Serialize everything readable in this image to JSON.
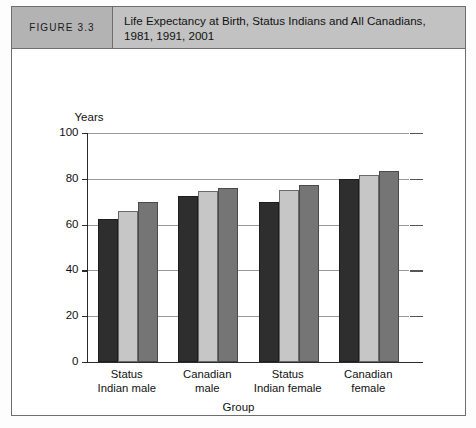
{
  "figure": {
    "tag": "FIGURE 3.3",
    "title": "Life Expectancy at Birth, Status Indians and All Canadians, 1981, 1991, 2001"
  },
  "chart_data": {
    "type": "bar",
    "title": "Life Expectancy at Birth, Status Indians and All Canadians, 1981, 1991, 2001",
    "xlabel": "Group",
    "ylabel": "Years",
    "ylim": [
      0,
      100
    ],
    "yticks": [
      0,
      20,
      40,
      60,
      80,
      100
    ],
    "ytick_labels": [
      "0",
      "20",
      "40",
      "60",
      "80",
      "100"
    ],
    "grid": true,
    "legend_position": "bottom",
    "categories": [
      "Status Indian male",
      "Canadian male",
      "Status Indian female",
      "Canadian female"
    ],
    "category_lines": [
      [
        "Status",
        "Indian male"
      ],
      [
        "Canadian",
        "male"
      ],
      [
        "Status",
        "Indian female"
      ],
      [
        "Canadian",
        "female"
      ]
    ],
    "series": [
      {
        "name": "1981",
        "color": "#2e2e2e",
        "values": [
          62.5,
          72.5,
          70.0,
          80.0
        ]
      },
      {
        "name": "1991",
        "color": "#c6c6c6",
        "values": [
          66.0,
          74.5,
          75.0,
          81.5
        ]
      },
      {
        "name": "2001",
        "color": "#757575",
        "values": [
          70.0,
          76.0,
          77.5,
          83.5
        ]
      }
    ]
  }
}
